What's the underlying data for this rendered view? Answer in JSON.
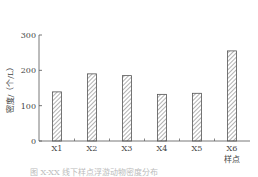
{
  "chart_data": {
    "type": "bar",
    "title": "",
    "xlabel": "样点",
    "ylabel": "密度/（个/L）",
    "categories": [
      "X1",
      "X2",
      "X3",
      "X4",
      "X5",
      "X6"
    ],
    "values": [
      139,
      190,
      185,
      132,
      135,
      255
    ],
    "ylim": [
      0,
      300
    ],
    "yticks": [
      0,
      100,
      200,
      300
    ],
    "grid": false,
    "legend": null,
    "bar_fill": "hatched"
  },
  "caption": "图 X-XX  线下样点浮游动物密度分布"
}
